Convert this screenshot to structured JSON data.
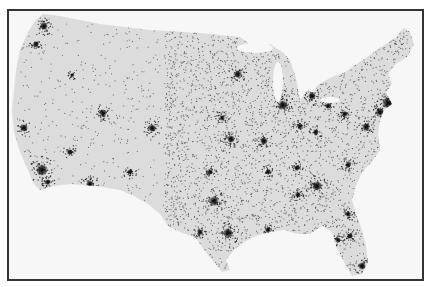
{
  "map": {
    "type": "dot-density population map",
    "region": "Contiguous United States",
    "colors": {
      "background": "#f7f7f7",
      "land": "#dcdcdc",
      "dots": "#1a1a1a",
      "frame": "#333333"
    },
    "outline": [
      [
        43,
        14
      ],
      [
        60,
        16
      ],
      [
        100,
        24
      ],
      [
        150,
        30
      ],
      [
        200,
        33
      ],
      [
        240,
        37
      ],
      [
        250,
        44
      ],
      [
        262,
        48
      ],
      [
        270,
        44
      ],
      [
        282,
        52
      ],
      [
        290,
        60
      ],
      [
        296,
        78
      ],
      [
        300,
        100
      ],
      [
        306,
        92
      ],
      [
        316,
        86
      ],
      [
        330,
        78
      ],
      [
        345,
        72
      ],
      [
        360,
        62
      ],
      [
        380,
        48
      ],
      [
        395,
        38
      ],
      [
        404,
        28
      ],
      [
        410,
        32
      ],
      [
        414,
        44
      ],
      [
        408,
        56
      ],
      [
        396,
        64
      ],
      [
        388,
        74
      ],
      [
        392,
        84
      ],
      [
        386,
        92
      ],
      [
        392,
        104
      ],
      [
        384,
        110
      ],
      [
        380,
        120
      ],
      [
        378,
        134
      ],
      [
        380,
        150
      ],
      [
        372,
        162
      ],
      [
        362,
        172
      ],
      [
        356,
        186
      ],
      [
        352,
        200
      ],
      [
        356,
        214
      ],
      [
        362,
        230
      ],
      [
        366,
        246
      ],
      [
        368,
        262
      ],
      [
        362,
        274
      ],
      [
        352,
        276
      ],
      [
        344,
        262
      ],
      [
        336,
        246
      ],
      [
        332,
        232
      ],
      [
        322,
        226
      ],
      [
        310,
        234
      ],
      [
        298,
        234
      ],
      [
        284,
        230
      ],
      [
        270,
        232
      ],
      [
        256,
        236
      ],
      [
        244,
        242
      ],
      [
        234,
        250
      ],
      [
        226,
        260
      ],
      [
        230,
        270
      ],
      [
        222,
        272
      ],
      [
        214,
        262
      ],
      [
        204,
        250
      ],
      [
        196,
        238
      ],
      [
        180,
        232
      ],
      [
        168,
        226
      ],
      [
        160,
        214
      ],
      [
        148,
        204
      ],
      [
        134,
        196
      ],
      [
        120,
        190
      ],
      [
        96,
        186
      ],
      [
        70,
        184
      ],
      [
        54,
        186
      ],
      [
        40,
        190
      ],
      [
        34,
        184
      ],
      [
        28,
        170
      ],
      [
        20,
        152
      ],
      [
        14,
        132
      ],
      [
        12,
        110
      ],
      [
        14,
        90
      ],
      [
        16,
        70
      ],
      [
        20,
        50
      ],
      [
        28,
        32
      ],
      [
        36,
        20
      ]
    ],
    "cities": [
      {
        "name": "Seattle",
        "x": 44,
        "y": 26,
        "r": 4
      },
      {
        "name": "Portland",
        "x": 36,
        "y": 44,
        "r": 3
      },
      {
        "name": "San Francisco Bay",
        "x": 24,
        "y": 128,
        "r": 4
      },
      {
        "name": "Los Angeles",
        "x": 42,
        "y": 170,
        "r": 6
      },
      {
        "name": "San Diego",
        "x": 48,
        "y": 182,
        "r": 3
      },
      {
        "name": "Las Vegas",
        "x": 70,
        "y": 152,
        "r": 3
      },
      {
        "name": "Phoenix",
        "x": 90,
        "y": 184,
        "r": 4
      },
      {
        "name": "Salt Lake City",
        "x": 103,
        "y": 113,
        "r": 4
      },
      {
        "name": "Denver",
        "x": 152,
        "y": 128,
        "r": 4
      },
      {
        "name": "Boise",
        "x": 72,
        "y": 75,
        "r": 2
      },
      {
        "name": "Albuquerque",
        "x": 130,
        "y": 172,
        "r": 3
      },
      {
        "name": "El Paso",
        "x": 128,
        "y": 204,
        "r": 2
      },
      {
        "name": "Minneapolis",
        "x": 238,
        "y": 74,
        "r": 4
      },
      {
        "name": "Chicago",
        "x": 283,
        "y": 105,
        "r": 5
      },
      {
        "name": "Detroit",
        "x": 312,
        "y": 96,
        "r": 4
      },
      {
        "name": "Milwaukee",
        "x": 280,
        "y": 94,
        "r": 3
      },
      {
        "name": "Kansas City",
        "x": 231,
        "y": 139,
        "r": 4
      },
      {
        "name": "Omaha",
        "x": 222,
        "y": 118,
        "r": 3
      },
      {
        "name": "St. Louis",
        "x": 264,
        "y": 141,
        "r": 4
      },
      {
        "name": "Indianapolis",
        "x": 300,
        "y": 126,
        "r": 3
      },
      {
        "name": "Cincinnati",
        "x": 316,
        "y": 132,
        "r": 3
      },
      {
        "name": "Cleveland",
        "x": 328,
        "y": 106,
        "r": 3
      },
      {
        "name": "Pittsburgh",
        "x": 345,
        "y": 114,
        "r": 3
      },
      {
        "name": "Dallas",
        "x": 214,
        "y": 201,
        "r": 5
      },
      {
        "name": "Oklahoma City",
        "x": 210,
        "y": 172,
        "r": 3
      },
      {
        "name": "Houston",
        "x": 228,
        "y": 233,
        "r": 5
      },
      {
        "name": "San Antonio",
        "x": 200,
        "y": 232,
        "r": 3
      },
      {
        "name": "Memphis",
        "x": 268,
        "y": 172,
        "r": 3
      },
      {
        "name": "Nashville",
        "x": 297,
        "y": 168,
        "r": 3
      },
      {
        "name": "Atlanta",
        "x": 317,
        "y": 186,
        "r": 5
      },
      {
        "name": "Birmingham",
        "x": 298,
        "y": 195,
        "r": 3
      },
      {
        "name": "New Orleans",
        "x": 268,
        "y": 230,
        "r": 3
      },
      {
        "name": "Charlotte",
        "x": 348,
        "y": 165,
        "r": 3
      },
      {
        "name": "Washington DC",
        "x": 366,
        "y": 127,
        "r": 4
      },
      {
        "name": "Philadelphia",
        "x": 380,
        "y": 112,
        "r": 4
      },
      {
        "name": "New York",
        "x": 388,
        "y": 103,
        "r": 6
      },
      {
        "name": "Boston",
        "x": 400,
        "y": 78,
        "r": 4
      },
      {
        "name": "Jacksonville",
        "x": 348,
        "y": 214,
        "r": 3
      },
      {
        "name": "Tampa",
        "x": 338,
        "y": 240,
        "r": 3
      },
      {
        "name": "Orlando",
        "x": 350,
        "y": 236,
        "r": 3
      },
      {
        "name": "Miami",
        "x": 362,
        "y": 266,
        "r": 4
      }
    ],
    "dot_density": {
      "west_count": 700,
      "east_count": 4200,
      "east_start_x": 185
    }
  }
}
